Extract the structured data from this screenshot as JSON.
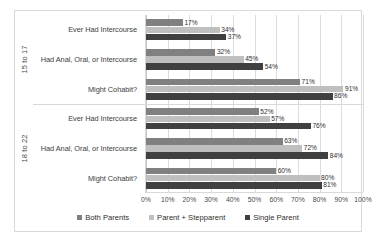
{
  "chart_data": {
    "type": "bar",
    "orientation": "horizontal",
    "title": "",
    "subtitle": "",
    "xlabel": "",
    "ylabel": "",
    "xlim": [
      0,
      100
    ],
    "grid": true,
    "grid_axis": "x",
    "legend_position": "bottom",
    "value_label_suffix": "%",
    "x_ticks": [
      "0%",
      "10%",
      "20%",
      "30%",
      "40%",
      "50%",
      "60%",
      "70%",
      "80%",
      "90%",
      "100%"
    ],
    "x_tick_values": [
      0,
      10,
      20,
      30,
      40,
      50,
      60,
      70,
      80,
      90,
      100
    ],
    "series": [
      {
        "name": "Both Parents",
        "color": "#808080"
      },
      {
        "name": "Parent + Stepparent",
        "color": "#bfbfbf"
      },
      {
        "name": "Single Parent",
        "color": "#404040"
      }
    ],
    "groups": [
      {
        "label": "15 to 17",
        "categories": [
          {
            "label": "Ever Had Intercourse",
            "values": [
              17,
              34,
              37
            ],
            "value_labels": [
              "17%",
              "34%",
              "37%"
            ]
          },
          {
            "label": "Had Anal, Oral, or Intercourse",
            "values": [
              32,
              45,
              54
            ],
            "value_labels": [
              "32%",
              "45%",
              "54%"
            ]
          },
          {
            "label": "Might Cohabit?",
            "values": [
              71,
              91,
              86
            ],
            "value_labels": [
              "71%",
              "91%",
              "86%"
            ]
          }
        ]
      },
      {
        "label": "18 to 22",
        "categories": [
          {
            "label": "Ever Had Intercourse",
            "values": [
              52,
              57,
              76
            ],
            "value_labels": [
              "52%",
              "57%",
              "76%"
            ]
          },
          {
            "label": "Had Anal, Oral, or Intercourse",
            "values": [
              63,
              72,
              84
            ],
            "value_labels": [
              "63%",
              "72%",
              "84%"
            ]
          },
          {
            "label": "Might Cohabit?",
            "values": [
              60,
              80,
              81
            ],
            "value_labels": [
              "60%",
              "80%",
              "81%"
            ]
          }
        ]
      }
    ]
  },
  "style": {
    "plot_background": "#ffffff",
    "border_color": "#d9d9d9",
    "gridline_color": "#dcdcdc"
  }
}
